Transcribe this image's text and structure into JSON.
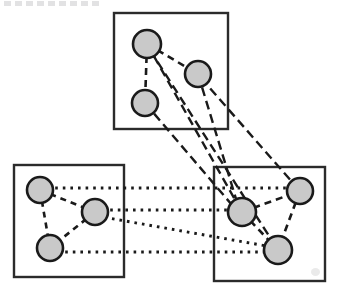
{
  "figure": {
    "title": "",
    "caption_fragment": "",
    "width": 339,
    "height": 295,
    "background_color": "#ffffff"
  },
  "style": {
    "node_fill": "#c9c9c9",
    "node_stroke": "#1a1a1a",
    "node_stroke_width": 2.6,
    "box_stroke": "#2b2b2b",
    "box_fill": "#ffffff",
    "box_stroke_width": 2.4,
    "edge_color": "#1a1a1a"
  },
  "graph_data": {
    "type": "node-link-diagram",
    "description": "Three rectangular cluster groups each containing three circular nodes, connected by dashed intra-cluster edges and dashed/dotted inter-cluster edges",
    "cluster_count": 3,
    "node_count": 9,
    "edge_count": 17,
    "clusters": [
      {
        "id": "cluster-top",
        "label": "",
        "x": 114,
        "y": 13,
        "width": 114,
        "height": 116,
        "node_ids": [
          "n1",
          "n2",
          "n3"
        ]
      },
      {
        "id": "cluster-left",
        "label": "",
        "x": 14,
        "y": 165,
        "width": 110,
        "height": 112,
        "node_ids": [
          "n4",
          "n5",
          "n6"
        ]
      },
      {
        "id": "cluster-right",
        "label": "",
        "x": 214,
        "y": 167,
        "width": 111,
        "height": 114,
        "node_ids": [
          "n7",
          "n8",
          "n9"
        ]
      }
    ],
    "nodes": [
      {
        "id": "n1",
        "label": "",
        "cluster": "cluster-top",
        "cx": 147,
        "cy": 44,
        "r": 14
      },
      {
        "id": "n2",
        "label": "",
        "cluster": "cluster-top",
        "cx": 198,
        "cy": 74,
        "r": 13
      },
      {
        "id": "n3",
        "label": "",
        "cluster": "cluster-top",
        "cx": 145,
        "cy": 103,
        "r": 13
      },
      {
        "id": "n4",
        "label": "",
        "cluster": "cluster-left",
        "cx": 40,
        "cy": 190,
        "r": 13
      },
      {
        "id": "n5",
        "label": "",
        "cluster": "cluster-left",
        "cx": 95,
        "cy": 212,
        "r": 13
      },
      {
        "id": "n6",
        "label": "",
        "cluster": "cluster-left",
        "cx": 50,
        "cy": 248,
        "r": 13
      },
      {
        "id": "n7",
        "label": "",
        "cluster": "cluster-right",
        "cx": 242,
        "cy": 212,
        "r": 14
      },
      {
        "id": "n8",
        "label": "",
        "cluster": "cluster-right",
        "cx": 300,
        "cy": 191,
        "r": 13
      },
      {
        "id": "n9",
        "label": "",
        "cluster": "cluster-right",
        "cx": 278,
        "cy": 250,
        "r": 14
      }
    ],
    "edges": [
      {
        "id": "e1",
        "source": "n1",
        "target": "n2",
        "kind": "intra-top",
        "style": "dashed"
      },
      {
        "id": "e2",
        "source": "n1",
        "target": "n3",
        "kind": "intra-top",
        "style": "dashed"
      },
      {
        "id": "e3",
        "source": "n4",
        "target": "n6",
        "kind": "intra-left",
        "style": "dotted"
      },
      {
        "id": "e4",
        "source": "n5",
        "target": "n6",
        "kind": "intra-left",
        "style": "dashed"
      },
      {
        "id": "e5",
        "source": "n4",
        "target": "n5",
        "kind": "intra-left",
        "style": "dotted"
      },
      {
        "id": "e6",
        "source": "n7",
        "target": "n8",
        "kind": "intra-right",
        "style": "dotted"
      },
      {
        "id": "e7",
        "source": "n8",
        "target": "n9",
        "kind": "intra-right",
        "style": "dashed"
      },
      {
        "id": "e8",
        "source": "n7",
        "target": "n9",
        "kind": "intra-right",
        "style": "dotted"
      },
      {
        "id": "e9",
        "source": "n1",
        "target": "n7",
        "kind": "top-right",
        "style": "dashed"
      },
      {
        "id": "e10",
        "source": "n1",
        "target": "n9",
        "kind": "top-right",
        "style": "dashed"
      },
      {
        "id": "e11",
        "source": "n2",
        "target": "n7",
        "kind": "top-right",
        "style": "dashed"
      },
      {
        "id": "e12",
        "source": "n2",
        "target": "n8",
        "kind": "top-right",
        "style": "dashed"
      },
      {
        "id": "e13",
        "source": "n3",
        "target": "n7",
        "kind": "top-right",
        "style": "dashed"
      },
      {
        "id": "e14",
        "source": "n4",
        "target": "n8",
        "kind": "left-right",
        "style": "dotted"
      },
      {
        "id": "e15",
        "source": "n5",
        "target": "n7",
        "kind": "left-right",
        "style": "dotted"
      },
      {
        "id": "e16",
        "source": "n5",
        "target": "n9",
        "kind": "left-right",
        "style": "dotted"
      },
      {
        "id": "e17",
        "source": "n6",
        "target": "n9",
        "kind": "left-right",
        "style": "dotted"
      }
    ]
  }
}
